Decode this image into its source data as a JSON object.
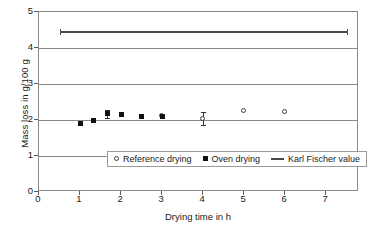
{
  "chart_data": {
    "type": "scatter",
    "title": "",
    "xlabel": "Drying time in h",
    "ylabel": "Mass loss in g/100 g",
    "xlim": [
      0,
      7.8
    ],
    "ylim": [
      0,
      5
    ],
    "xticks": [
      "0",
      "1",
      "2",
      "3",
      "4",
      "5",
      "6",
      "7"
    ],
    "xtick_values": [
      0,
      1,
      2,
      3,
      4,
      5,
      6,
      7
    ],
    "yticks": [
      "0",
      "1",
      "2",
      "3",
      "4",
      "5"
    ],
    "ytick_values": [
      0,
      1,
      2,
      3,
      4,
      5
    ],
    "grid": true,
    "grid_axis": "y",
    "legend_position": "lower center inside",
    "series": [
      {
        "name": "Reference drying",
        "marker": "open-circle",
        "color": "#3d3d3d",
        "points": [
          {
            "x": 3.0,
            "y": 2.12
          },
          {
            "x": 4.0,
            "y": 2.03,
            "yerr": 0.18
          },
          {
            "x": 5.0,
            "y": 2.24
          },
          {
            "x": 6.0,
            "y": 2.22
          }
        ]
      },
      {
        "name": "Oven drying",
        "marker": "filled-square",
        "color": "#111111",
        "points": [
          {
            "x": 1.0,
            "y": 1.91
          },
          {
            "x": 1.33,
            "y": 1.98
          },
          {
            "x": 1.67,
            "y": 2.17,
            "yerr": 0.11
          },
          {
            "x": 2.0,
            "y": 2.14
          },
          {
            "x": 2.5,
            "y": 2.1
          },
          {
            "x": 3.0,
            "y": 2.09
          }
        ]
      },
      {
        "name": "Karl Fischer value",
        "marker": "line",
        "color": "#4a4a4a",
        "value": 4.45,
        "x_start": 0.5,
        "x_end": 7.5
      }
    ]
  },
  "legend": {
    "entries": [
      {
        "label": "Reference drying",
        "glyph": "open-circle-marker"
      },
      {
        "label": "Oven drying",
        "glyph": "filled-square-marker"
      },
      {
        "label": "Karl Fischer value",
        "glyph": "horizontal-line-marker"
      }
    ]
  },
  "colors": {
    "axis": "#8a8a8a",
    "gridline": "#8a8a8a",
    "text": "#1a1a1a",
    "kf_line": "#4a4a4a"
  }
}
